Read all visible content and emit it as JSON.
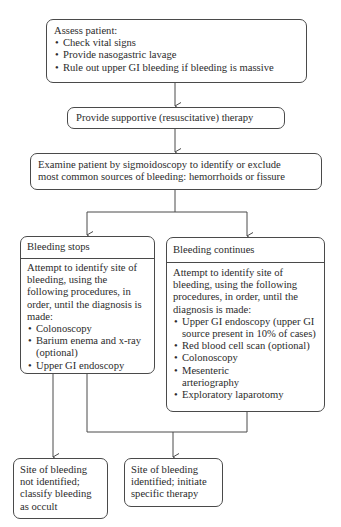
{
  "diagram": {
    "assess": {
      "title": "Assess patient:",
      "items": [
        "Check vital signs",
        "Provide nasogastric lavage",
        "Rule out upper GI bleeding if bleeding is massive"
      ]
    },
    "supportive": {
      "text": "Provide supportive (resuscitative) therapy"
    },
    "examine": {
      "line1": "Examine patient by sigmoidoscopy to identify or exclude",
      "line2": "most common sources of bleeding: hemorrhoids or fissure"
    },
    "stops": {
      "header": "Bleeding stops",
      "intro": "Attempt to identify site of bleeding, using the following procedures, in order, until the diagnosis is made:",
      "items": [
        "Colonoscopy",
        "Barium enema and x-ray (optional)",
        "Upper GI endoscopy"
      ]
    },
    "continues": {
      "header": "Bleeding continues",
      "intro": "Attempt to identify site of bleeding, using the following procedures, in order, until the diagnosis is made:",
      "items": [
        "Upper GI endoscopy (upper GI source present in 10% of cases)",
        "Red blood cell scan (optional)",
        "Colonoscopy",
        "Mesenteric arteriography",
        "Exploratory laparotomy"
      ]
    },
    "not_identified": {
      "text": "Site of bleeding not identified; classify bleeding as occult"
    },
    "identified": {
      "text": "Site of bleeding identified; initiate specific therapy"
    }
  },
  "colors": {
    "line": "#4a4a4a",
    "text": "#2b2b2b",
    "background": "#ffffff"
  }
}
